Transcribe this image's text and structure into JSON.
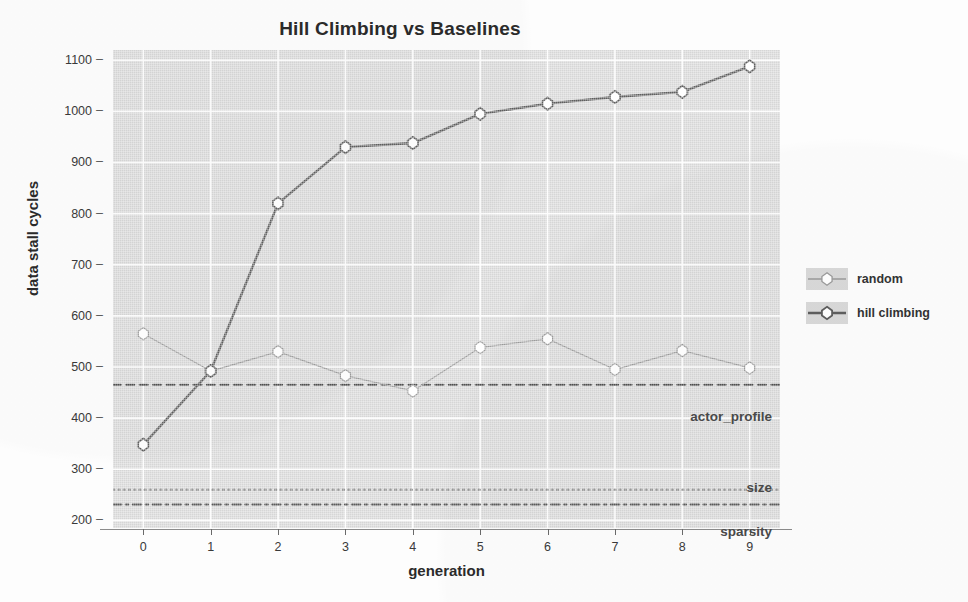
{
  "chart_data": {
    "type": "line",
    "title": "Hill Climbing vs Baselines",
    "xlabel": "generation",
    "ylabel": "data stall cycles",
    "x": [
      0,
      1,
      2,
      3,
      4,
      5,
      6,
      7,
      8,
      9
    ],
    "xtick_labels": [
      "0",
      "1",
      "2",
      "3",
      "4",
      "5",
      "6",
      "7",
      "8",
      "9"
    ],
    "ytick_labels": [
      "200",
      "300",
      "400",
      "500",
      "600",
      "700",
      "800",
      "900",
      "1000",
      "1100"
    ],
    "ytick_values": [
      200,
      300,
      400,
      500,
      600,
      700,
      800,
      900,
      1000,
      1100
    ],
    "xlim": [
      -0.45,
      9.45
    ],
    "ylim": [
      185,
      1120
    ],
    "grid": true,
    "legend_position": "right",
    "series": [
      {
        "name": "random",
        "values": [
          565,
          492,
          530,
          483,
          453,
          538,
          555,
          495,
          532,
          498
        ],
        "color": "#9a9a9a",
        "linestyle": "solid",
        "linewidth": 1.3,
        "marker": "diamond"
      },
      {
        "name": "hill climbing",
        "values": [
          348,
          492,
          820,
          930,
          938,
          995,
          1015,
          1028,
          1038,
          1088
        ],
        "color": "#5e5e5e",
        "linestyle": "solid",
        "linewidth": 2.4,
        "marker": "diamond"
      }
    ],
    "baselines": [
      {
        "name": "actor_profile",
        "value": 465,
        "linestyle": "dashed",
        "color": "#4f4f4f",
        "label": "actor_profile",
        "label_position": "right"
      },
      {
        "name": "size",
        "value": 260,
        "linestyle": "dotted",
        "color": "#6e6e6e",
        "label": "size",
        "label_position": "right"
      },
      {
        "name": "sparsity",
        "value": 231,
        "linestyle": "dashdot",
        "color": "#5a5a5a",
        "label": "sparsity",
        "label_position": "right"
      }
    ],
    "annotations": [
      "actor_profile",
      "size",
      "sparsity"
    ]
  },
  "figure": {
    "panel_background": "#d6d6d6",
    "grid_color": "#ffffff",
    "figure_background": "#fdfdfd",
    "text_color": "#2b2b2b"
  },
  "legend": {
    "entries": [
      {
        "label": "random"
      },
      {
        "label": "hill climbing"
      }
    ]
  }
}
